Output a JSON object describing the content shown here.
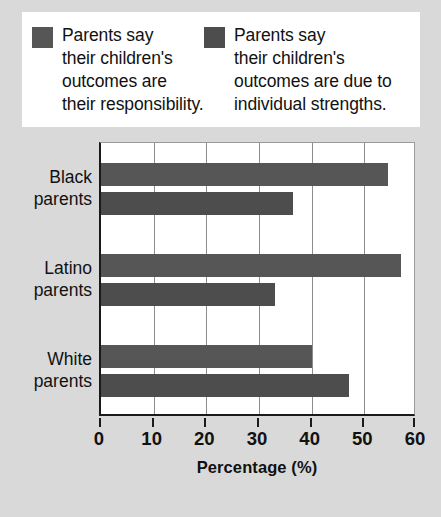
{
  "colors": {
    "page_background": "#d9d9d9",
    "panel_background": "#ffffff",
    "series_1": "#565656",
    "series_2": "#4d4d4d",
    "axis": "#1a1a1a",
    "gridline": "#8c8c8c",
    "text": "#111111"
  },
  "legend": {
    "entries": [
      {
        "swatch_color": "#565656",
        "label": "Parents say\ntheir children's\noutcomes are\ntheir responsibility."
      },
      {
        "swatch_color": "#4d4d4d",
        "label": "Parents say\ntheir children's\noutcomes are due to\nindividual strengths."
      }
    ]
  },
  "chart_data": {
    "type": "bar",
    "orientation": "horizontal",
    "title": "",
    "xlabel": "Percentage (%)",
    "ylabel": "",
    "xlim": [
      0,
      60
    ],
    "xticks": [
      0,
      10,
      20,
      30,
      40,
      50,
      60
    ],
    "xtick_labels": [
      "0",
      "10",
      "20",
      "30",
      "40",
      "50",
      "60"
    ],
    "grid": true,
    "grid_axis": "x",
    "legend_position": "top",
    "categories": [
      "Black\nparents",
      "Latino\nparents",
      "White\nparents"
    ],
    "series": [
      {
        "name": "Parents say their children's outcomes are their responsibility.",
        "color": "#565656",
        "values": [
          54.5,
          57,
          40
        ]
      },
      {
        "name": "Parents say their children's outcomes are due to individual strengths.",
        "color": "#4d4d4d",
        "values": [
          36.5,
          33,
          47
        ]
      }
    ]
  }
}
